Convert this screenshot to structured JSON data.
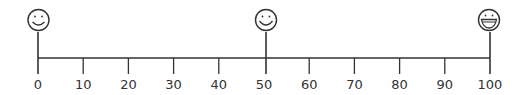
{
  "number_line": {
    "min": 0,
    "max": 100,
    "step": 10,
    "tick_labels": [
      "0",
      "10",
      "20",
      "30",
      "40",
      "50",
      "60",
      "70",
      "80",
      "90",
      "100"
    ]
  },
  "markers": [
    {
      "value": 0,
      "icon": "slight-smile-face-icon"
    },
    {
      "value": 50,
      "icon": "smile-face-icon"
    },
    {
      "value": 100,
      "icon": "big-grin-face-icon"
    }
  ],
  "colors": {
    "line": "#333333",
    "background": "#ffffff"
  }
}
